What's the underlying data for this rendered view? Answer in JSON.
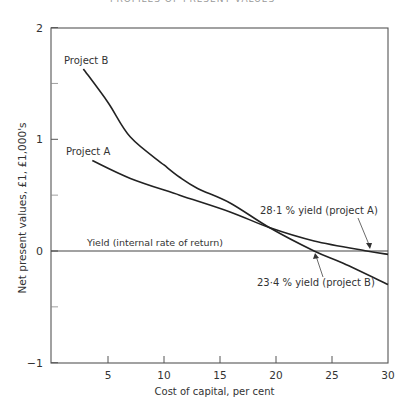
{
  "page_header": "PROFILES OF PRESENT VALUES",
  "chart_data": {
    "type": "line",
    "title": "",
    "xlabel": "Cost of capital, per cent",
    "ylabel": "Net present values, £1, £1,000's",
    "xlim": [
      0,
      30
    ],
    "ylim": [
      -1,
      2
    ],
    "x_ticks": [
      5,
      10,
      15,
      20,
      25,
      30
    ],
    "x_tick_labels": [
      "5",
      "10",
      "15",
      "20",
      "25",
      "30"
    ],
    "y_ticks": [
      -1,
      0,
      1,
      2
    ],
    "y_tick_labels": [
      "−1",
      "0",
      "1",
      "2"
    ],
    "y_minor_ticks": [
      -0.5,
      0.5,
      1.5
    ],
    "grid": false,
    "series": [
      {
        "name": "Project B",
        "x": [
          2.8,
          5,
          7,
          10,
          11.4,
          13,
          15.9,
          19.4,
          23.4,
          26,
          30
        ],
        "values": [
          1.63,
          1.33,
          1.02,
          0.77,
          0.66,
          0.56,
          0.43,
          0.21,
          0.0,
          -0.11,
          -0.3
        ]
      },
      {
        "name": "Project A",
        "x": [
          3.6,
          7,
          11.4,
          15.9,
          19.4,
          23.4,
          28.1,
          30
        ],
        "values": [
          0.81,
          0.65,
          0.5,
          0.35,
          0.21,
          0.09,
          0.0,
          -0.03
        ]
      }
    ],
    "reference_lines": [
      {
        "y": 0,
        "label": "Yield (internal rate of return)"
      }
    ],
    "annotations": [
      {
        "text": "28·1 % yield (project A)",
        "x": 28.1,
        "y": 0
      },
      {
        "text": "23·4 % yield (project B)",
        "x": 23.4,
        "y": 0
      }
    ],
    "series_labels": [
      {
        "text": "Project B",
        "x": 2.8,
        "y": 1.63
      },
      {
        "text": "Project A",
        "x": 3.6,
        "y": 0.81
      }
    ]
  }
}
